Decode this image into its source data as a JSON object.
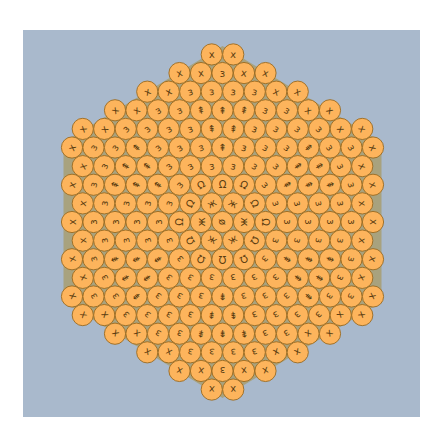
{
  "figure": {
    "title": "",
    "colors": {
      "page_background": "#ffffff",
      "panel": "#a9b9cc",
      "gap_fill": "#a8a27e",
      "circle_fill": "#fdb45c",
      "circle_stroke": "#9a6a20",
      "glyph": "#5a3c10"
    },
    "geometry": {
      "center_x": 222.5,
      "center_y": 222,
      "spacing_x": 21.5,
      "radius": 10.6,
      "half_width_limit": 153,
      "hex_limit": 176,
      "rows_each_side": 9
    },
    "glyphs": {
      "center": "ø",
      "ring1": "ж",
      "ring2": "Ω",
      "lobe_center": "ø",
      "lobe": "⇞",
      "band": "ɜ",
      "border": "x",
      "border_split": "o",
      "junction_split": [
        "z",
        "ʌ",
        "z"
      ]
    }
  }
}
